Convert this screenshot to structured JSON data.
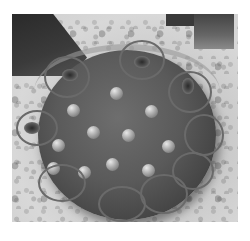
{
  "image": {
    "description": "Grayscale photo of a worn button drill bit resting on gravel ground, with circles highlighting worn/damaged carbide buttons",
    "subject": "button drill bit",
    "annotations": {
      "marker_shape": "circle",
      "marker_color": "#6a6a6a",
      "count": 9
    }
  }
}
